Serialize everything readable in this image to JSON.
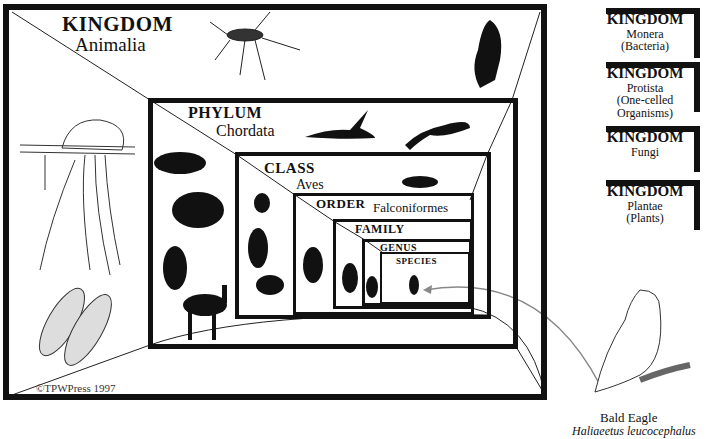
{
  "diagram": {
    "levels": [
      {
        "rank": "KINGDOM",
        "name": "Animalia"
      },
      {
        "rank": "PHYLUM",
        "name": "Chordata"
      },
      {
        "rank": "CLASS",
        "name": "Aves"
      },
      {
        "rank": "ORDER",
        "name": "Falconiformes"
      },
      {
        "rank": "FAMILY",
        "name": ""
      },
      {
        "rank": "GENUS",
        "name": ""
      },
      {
        "rank": "SPECIES",
        "name": ""
      }
    ],
    "other_kingdoms": [
      {
        "rank": "KINGDOM",
        "name": "Monera",
        "note": "(Bacteria)"
      },
      {
        "rank": "KINGDOM",
        "name": "Protista",
        "note": "(One-celled",
        "note2": "Organisms)"
      },
      {
        "rank": "KINGDOM",
        "name": "Fungi",
        "note": ""
      },
      {
        "rank": "KINGDOM",
        "name": "Plantae",
        "note": "(Plants)"
      }
    ],
    "subject": {
      "common_name": "Bald Eagle",
      "scientific_name": "Haliaeetus leucocephalus"
    },
    "copyright": "©TPWPress 1997",
    "illustrations": [
      "mosquito-icon",
      "portuguese-man-o-war-icon",
      "clam-shell-icon",
      "bird-silhouette-icon",
      "heron-icon",
      "lizard-icon",
      "fish-icon",
      "frog-icon",
      "deer-icon",
      "duck-icon",
      "hummingbird-icon",
      "robin-icon",
      "falcon-icon",
      "bald-eagle-icon"
    ],
    "colors": {
      "ink": "#111111",
      "arrow": "#888888",
      "background": "#ffffff"
    }
  }
}
